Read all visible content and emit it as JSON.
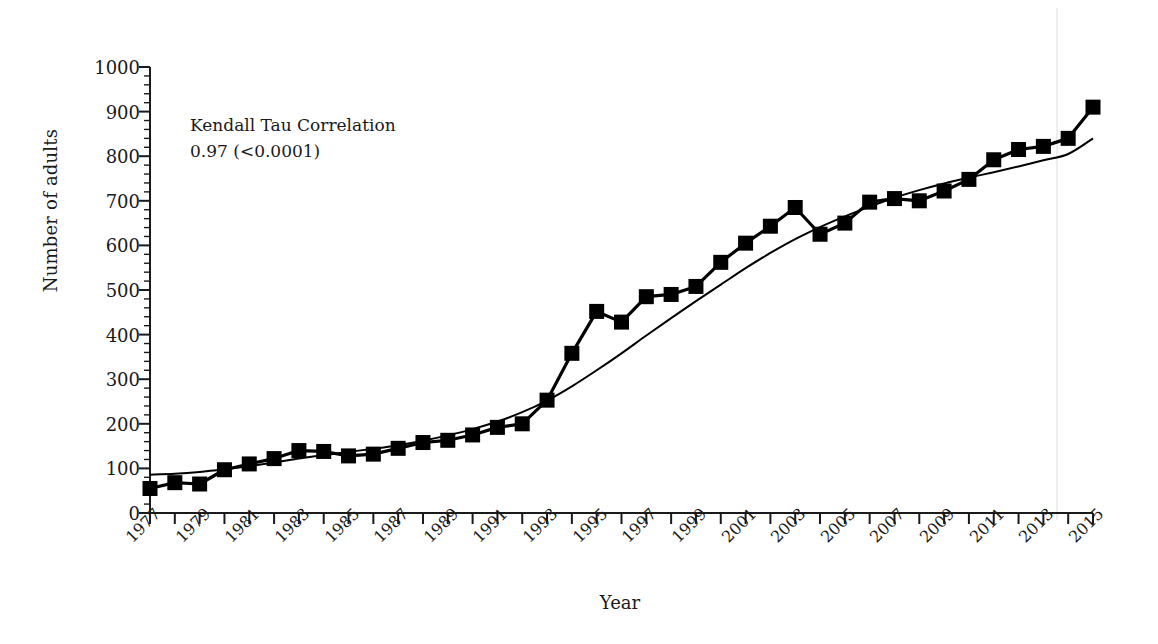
{
  "chart_data": {
    "type": "line",
    "title": "",
    "subtitle": "",
    "xlabel": "Year",
    "ylabel": "Number of adults",
    "xlim": [
      1977,
      2015
    ],
    "ylim": [
      0,
      1000
    ],
    "y_ticks": [
      0,
      100,
      200,
      300,
      400,
      500,
      600,
      700,
      800,
      900,
      1000
    ],
    "y_minor_tick_interval": 20,
    "x_tick_interval": 1,
    "x_tick_labels": [
      "1977",
      "1979",
      "1981",
      "1983",
      "1985",
      "1987",
      "1989",
      "1991",
      "1993",
      "1995",
      "1997",
      "1999",
      "2001",
      "2003",
      "2005",
      "2007",
      "2009",
      "2011",
      "2013",
      "2015"
    ],
    "x_label_interval": 2,
    "x_label_rotation_deg": -45,
    "grid": false,
    "legend": "none",
    "marker": "filled-square",
    "marker_color": "#000000",
    "line_color": "#000000",
    "trend_line_color": "#000000",
    "trend_line_type": "fitted-sigmoid-curve",
    "x": [
      1977,
      1978,
      1979,
      1980,
      1981,
      1982,
      1983,
      1984,
      1985,
      1986,
      1987,
      1988,
      1989,
      1990,
      1991,
      1992,
      1993,
      1994,
      1995,
      1996,
      1997,
      1998,
      1999,
      2000,
      2001,
      2002,
      2003,
      2004,
      2005,
      2006,
      2007,
      2008,
      2009,
      2010,
      2011,
      2012,
      2013,
      2014,
      2015
    ],
    "series": [
      {
        "name": "Number of adults",
        "values": [
          55,
          68,
          65,
          97,
          110,
          122,
          140,
          138,
          128,
          132,
          145,
          158,
          163,
          175,
          192,
          200,
          253,
          358,
          452,
          428,
          485,
          490,
          508,
          562,
          605,
          643,
          685,
          625,
          650,
          697,
          705,
          700,
          722,
          748,
          792,
          815,
          822,
          840,
          910
        ]
      },
      {
        "name": "Fitted trend",
        "values": [
          86,
          88,
          92,
          98,
          105,
          113,
          122,
          130,
          137,
          144,
          152,
          162,
          174,
          188,
          205,
          226,
          252,
          284,
          320,
          358,
          398,
          437,
          475,
          512,
          549,
          583,
          614,
          641,
          665,
          687,
          707,
          724,
          739,
          752,
          764,
          777,
          791,
          805,
          840
        ]
      }
    ],
    "annotations": [
      {
        "name": "kendall-tau-correlation",
        "line1": "Kendall Tau Correlation",
        "line2": "0.97 (<0.0001)"
      }
    ]
  }
}
